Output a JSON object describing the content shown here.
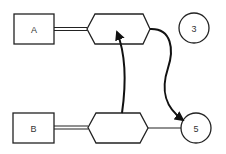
{
  "diagram": {
    "nodes": [
      {
        "id": "A",
        "type": "rectangle",
        "label": "A"
      },
      {
        "id": "hex_top",
        "type": "hexagon",
        "label": ""
      },
      {
        "id": "circle_3",
        "type": "circle",
        "label": "3"
      },
      {
        "id": "B",
        "type": "rectangle",
        "label": "B"
      },
      {
        "id": "hex_bottom",
        "type": "hexagon",
        "label": ""
      },
      {
        "id": "circle_5",
        "type": "circle",
        "label": "5"
      }
    ],
    "edges": [
      {
        "from": "A",
        "to": "hex_top",
        "style": "double-line"
      },
      {
        "from": "B",
        "to": "hex_bottom",
        "style": "double-line"
      },
      {
        "from": "hex_bottom",
        "to": "circle_5",
        "style": "single-line"
      },
      {
        "from": "hex_bottom",
        "to": "hex_top",
        "style": "curved-arrow"
      },
      {
        "from": "hex_top",
        "to": "circle_5",
        "style": "curved-arrow"
      }
    ],
    "colors": {
      "stroke": "#222222",
      "background": "#ffffff",
      "text": "#333333"
    }
  }
}
